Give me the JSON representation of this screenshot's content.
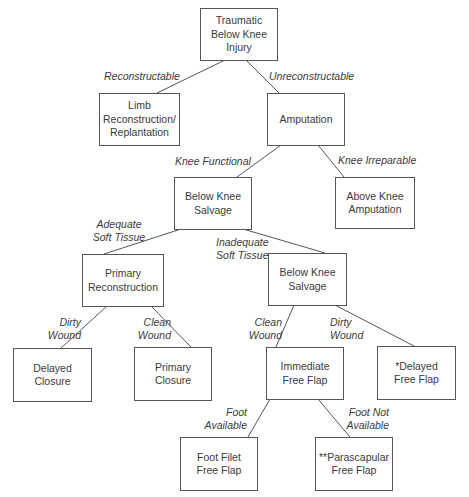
{
  "diagram": {
    "type": "decision-tree",
    "nodes": {
      "root": "Traumatic\nBelow Knee\nInjury",
      "limb": "Limb\nReconstruction/\nReplantation",
      "amputation": "Amputation",
      "bks1": "Below Knee\nSalvage",
      "aka": "Above Knee\nAmputation",
      "primary_recon": "Primary\nReconstruction",
      "bks2": "Below Knee\nSalvage",
      "delayed_closure": "Delayed\nClosure",
      "primary_closure": "Primary\nClosure",
      "immediate_flap": "Immediate\nFree Flap",
      "delayed_flap": "*Delayed\nFree Flap",
      "foot_filet": "Foot Filet\nFree Flap",
      "parascapular": "**Parascapular\nFree Flap"
    },
    "edge_labels": {
      "reconstructable": "Reconstructable",
      "unreconstructable": "Unreconstructable",
      "knee_functional": "Knee Functional",
      "knee_irreparable": "Knee Irreparable",
      "adequate": "Adequate\nSoft Tissue",
      "inadequate": "Inadequate\nSoft Tissue",
      "dirty1": "Dirty\nWound",
      "clean1": "Clean\nWound",
      "clean2": "Clean\nWound",
      "dirty2": "Dirty\nWound",
      "foot_avail": "Foot\nAvailable",
      "foot_not_avail": "Foot Not\nAvailable"
    }
  }
}
